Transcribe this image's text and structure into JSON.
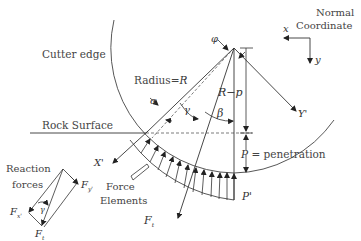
{
  "diagram": {
    "type": "disc-cutter-force-diagram",
    "labels": {
      "cutter_edge": "Cutter edge",
      "normal": "Normal",
      "coordinate": "Coordinate",
      "axis_x": "x",
      "axis_y": "y",
      "radius": "Radius = R",
      "phi": "φ",
      "alpha": "α",
      "gamma": "γ",
      "beta": "β",
      "r_minus_p": "R−p",
      "y_prime": "Y'",
      "x_prime": "X'",
      "rock_surface": "Rock Surface",
      "penetration": "P = penetration",
      "p_prime": "P'",
      "reaction": "Reaction",
      "forces": "forces",
      "force": "Force",
      "elements": "Elements",
      "f_t_main": "Ft",
      "fx": "Fx'",
      "fy": "Fy'",
      "ft": "Ft",
      "gamma_small": "γ"
    },
    "colors": {
      "line": "#333333",
      "text": "#444444"
    }
  }
}
